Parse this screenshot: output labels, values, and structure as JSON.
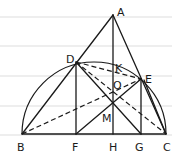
{
  "diagram": {
    "type": "geometry",
    "colors": {
      "ink": "#1a1a1a",
      "ruled_line": "#d4d4d4",
      "paper": "#ffffff"
    },
    "points": {
      "A": {
        "label": "A",
        "x": 113,
        "y": 15
      },
      "B": {
        "label": "B",
        "x": 22,
        "y": 134
      },
      "C": {
        "label": "C",
        "x": 166,
        "y": 134
      },
      "D": {
        "label": "D",
        "x": 76,
        "y": 62
      },
      "E": {
        "label": "E",
        "x": 141,
        "y": 79
      },
      "F": {
        "label": "F",
        "x": 76,
        "y": 134
      },
      "H": {
        "label": "H",
        "x": 113,
        "y": 134
      },
      "G": {
        "label": "G",
        "x": 141,
        "y": 134
      },
      "K": {
        "label": "K",
        "x": 113,
        "y": 70
      },
      "O": {
        "label": "O",
        "x": 113,
        "y": 85
      },
      "M": {
        "label": "M",
        "x": 113,
        "y": 103
      }
    },
    "solid_segments": [
      "AB",
      "AC",
      "AH",
      "BC",
      "DF",
      "EG",
      "BD",
      "DG",
      "FE",
      "EC"
    ],
    "dashed_segments": [
      "DE",
      "DC",
      "BE"
    ],
    "arcs": [
      "semicircle on BC through D and E"
    ]
  }
}
